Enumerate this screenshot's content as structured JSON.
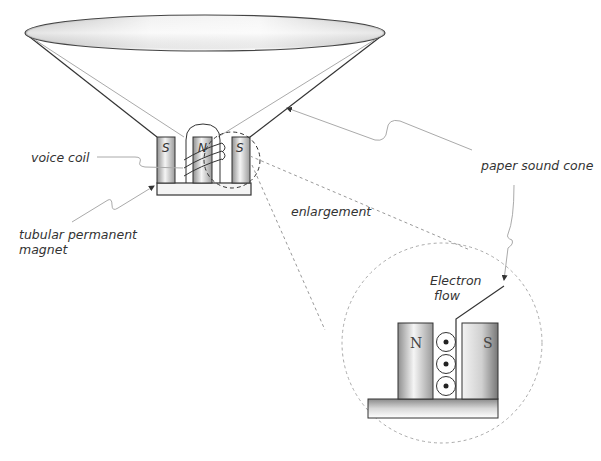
{
  "diagram": {
    "type": "loudspeaker-cross-section",
    "top_caption_partial": "",
    "labels": {
      "voice_coil": "voice coil",
      "magnet_line1": "tubular permanent",
      "magnet_line2": "magnet",
      "cone": "paper sound cone",
      "enlargement": "enlargement",
      "electron_line1": "Electron",
      "electron_line2": "flow"
    },
    "speaker_magnets": [
      {
        "pole": "S"
      },
      {
        "pole": "N"
      },
      {
        "pole": "S"
      }
    ],
    "enlarged_magnets": [
      {
        "pole": "N"
      },
      {
        "pole": "S"
      }
    ],
    "coil_cross_sections": 3,
    "colors": {
      "outline": "#333333",
      "leader": "#aaaaaa",
      "dashed": "#999999",
      "magnet_dark": "#8a8a8a",
      "magnet_light": "#f4f4f4"
    }
  }
}
